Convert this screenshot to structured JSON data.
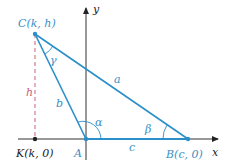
{
  "colors": {
    "triangle": "#2b8fc9",
    "axis": "#333333",
    "height": "#d0607a",
    "label": "#3a8fc4",
    "dark": "#222222"
  },
  "points": {
    "C": {
      "label": "C(k, h)"
    },
    "A": {
      "label": "A"
    },
    "B": {
      "label": "B(c, 0)"
    },
    "K": {
      "label": "K(k, 0)"
    }
  },
  "sides": {
    "a": "a",
    "b": "b",
    "c": "c",
    "h": "h"
  },
  "angles": {
    "alpha": "α",
    "beta": "β",
    "gamma": "γ"
  },
  "axes": {
    "x": "x",
    "y": "y"
  }
}
